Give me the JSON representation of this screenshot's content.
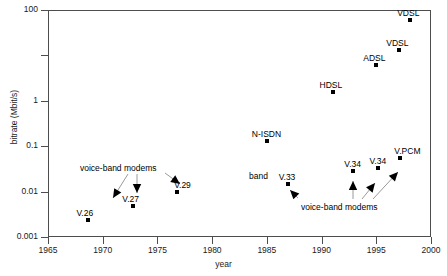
{
  "chart_data": {
    "type": "scatter",
    "title": "",
    "xlabel": "year",
    "ylabel": "bitrate (Mbit/s)",
    "xlim": [
      1965,
      2000
    ],
    "ylim": [
      0.001,
      100
    ],
    "yscale": "log",
    "grid": false,
    "legend": "none",
    "xticks": [
      "1965",
      "1970",
      "1975",
      "1980",
      "1985",
      "1990",
      "1995",
      "2000"
    ],
    "xtick_values": [
      1965,
      1970,
      1975,
      1980,
      1985,
      1990,
      1995,
      2000
    ],
    "yticks": [
      "100",
      "",
      "1",
      "0.1",
      "0.01",
      "0.001"
    ],
    "ytick_values": [
      100,
      10,
      1,
      0.1,
      0.01,
      0.001
    ],
    "points": [
      {
        "label": "V.26",
        "x": 1968.7,
        "y": 0.0024,
        "label_dx": -12,
        "label_dy": -11
      },
      {
        "label": "V.27",
        "x": 1972.8,
        "y": 0.0048,
        "label_dx": -11,
        "label_dy": -11
      },
      {
        "label": "V.29",
        "x": 1976.8,
        "y": 0.0096,
        "label_dx": -3,
        "label_dy": -11
      },
      {
        "label": "N-ISDN",
        "x": 1985.0,
        "y": 0.128,
        "label_dx": -15,
        "label_dy": -11
      },
      {
        "label": "V.33",
        "x": 1986.9,
        "y": 0.0144,
        "label_dx": -9,
        "label_dy": -11
      },
      {
        "label": "HDSL",
        "x": 1991.0,
        "y": 1.6,
        "label_dx": -13,
        "label_dy": -11
      },
      {
        "label": "V.34",
        "x": 1992.9,
        "y": 0.0288,
        "label_dx": -9,
        "label_dy": -11
      },
      {
        "label": "ADSL",
        "x": 1995.0,
        "y": 6.0,
        "label_dx": -13,
        "label_dy": -11
      },
      {
        "label": "V.34",
        "x": 1995.2,
        "y": 0.0336,
        "label_dx": -9,
        "label_dy": -11
      },
      {
        "label": "VDSL",
        "x": 1997.1,
        "y": 13.0,
        "label_dx": -13,
        "label_dy": -11
      },
      {
        "label": "V.PCM",
        "x": 1997.2,
        "y": 0.056,
        "label_dx": -6,
        "label_dy": -11
      },
      {
        "label": "VDSL",
        "x": 1998.1,
        "y": 60.0,
        "label_dx": -13,
        "label_dy": -11
      }
    ],
    "annotations": [
      {
        "text": "voice-band modems",
        "x": 80,
        "y": 164,
        "arrows": [
          {
            "x1": 128,
            "y1": 174,
            "x2": 113,
            "y2": 198,
            "head": "down-right"
          },
          {
            "x1": 137,
            "y1": 174,
            "x2": 137,
            "y2": 193,
            "head": "down"
          },
          {
            "x1": 165,
            "y1": 173,
            "x2": 180,
            "y2": 184,
            "head": "down-left"
          }
        ]
      },
      {
        "text": "band",
        "x": 249,
        "y": 172,
        "arrows": []
      },
      {
        "text": "voice-band  modems",
        "x": 301,
        "y": 203,
        "arrows": [
          {
            "x1": 353,
            "y1": 199,
            "x2": 353,
            "y2": 181,
            "head": "up"
          },
          {
            "x1": 362,
            "y1": 199,
            "x2": 375,
            "y2": 183,
            "head": "up-right"
          },
          {
            "x1": 373,
            "y1": 199,
            "x2": 398,
            "y2": 172,
            "head": "up-right"
          },
          {
            "x1": 298,
            "y1": 198,
            "x2": 290,
            "y2": 190,
            "head": "up-left"
          }
        ]
      }
    ]
  },
  "axes": {
    "x_title": "year",
    "y_title": "bitrate (Mbit/s)"
  }
}
